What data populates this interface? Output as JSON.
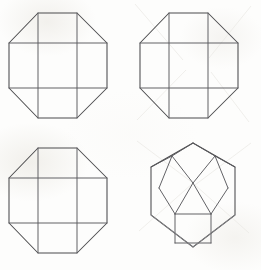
{
  "sheet": {
    "title": "Geometric line-drawing sheet",
    "description": "Four hand-drawn polyhedron projections arranged in a two-by-two grid on off-white paper",
    "width": 261,
    "height": 270,
    "background_color": "#fdfdfc",
    "ink_color": "#4a4a4c",
    "inner_ink_color": "#5a5a5e",
    "layout": "2x2 grid, no labels, no axes, no captions"
  },
  "figures": [
    {
      "id": "figure-top-left",
      "name": "octagon-with-inscribed-square-grid",
      "position": "top-left",
      "shape_type": "regular octagon",
      "inner_structure": "square grid formed by two vertical and two horizontal chords",
      "face_count_visible": 9,
      "origin_x": 0,
      "origin_y": 0,
      "outline_points": "38,13 77,13 107,43 107,88 77,118 38,118 9,88 9,43",
      "inner_lines": [
        "M38,13 L38,118",
        "M77,13 L77,118",
        "M9,43 L107,43",
        "M9,88 L107,88"
      ]
    },
    {
      "id": "figure-top-right",
      "name": "octagon-with-inscribed-square-grid",
      "position": "top-right",
      "shape_type": "regular octagon",
      "inner_structure": "square grid formed by two vertical and two horizontal chords",
      "face_count_visible": 9,
      "origin_x": 131,
      "origin_y": 0,
      "outline_points": "38,13 77,13 107,43 107,88 77,118 38,118 9,88 9,43",
      "inner_lines": [
        "M38,13 L38,118",
        "M77,13 L77,118",
        "M9,43 L107,43",
        "M9,88 L107,88"
      ]
    },
    {
      "id": "figure-bottom-left",
      "name": "octagon-with-inscribed-square-grid",
      "position": "bottom-left",
      "shape_type": "regular octagon",
      "inner_structure": "square grid formed by two vertical and two horizontal chords",
      "face_count_visible": 9,
      "origin_x": 0,
      "origin_y": 135,
      "outline_points": "38,13 77,13 107,43 107,88 77,118 38,118 9,88 9,43",
      "inner_lines": [
        "M38,13 L38,118",
        "M77,13 L77,118",
        "M9,43 L107,43",
        "M9,88 L107,88"
      ]
    },
    {
      "id": "figure-bottom-right",
      "name": "hexagon-with-pentagonal-facets",
      "position": "bottom-right",
      "shape_type": "hexagonal outline (dodecahedron projection)",
      "inner_structure": "three pentagonal facets meeting at an upper centre node above a central square",
      "face_count_visible": 6,
      "origin_x": 131,
      "origin_y": 135,
      "outline_points": "62,8 104,32 104,80 62,112 20,80 20,32",
      "inner_lines": [
        "M62,8 L41,21",
        "M62,8 L84,21",
        "M41,21 L20,32",
        "M84,21 L104,32",
        "M41,21 L28,53",
        "M84,21 L97,53",
        "M41,21 L62,48",
        "M84,21 L62,48",
        "M62,48 L44,79",
        "M62,48 L80,79",
        "M28,53 L44,79",
        "M97,53 L80,79",
        "M44,79 L44,108",
        "M80,79 L80,108",
        "M44,79 L80,79",
        "M44,108 L80,108",
        "M20,80 L62,112",
        "M104,80 L62,112"
      ]
    }
  ]
}
